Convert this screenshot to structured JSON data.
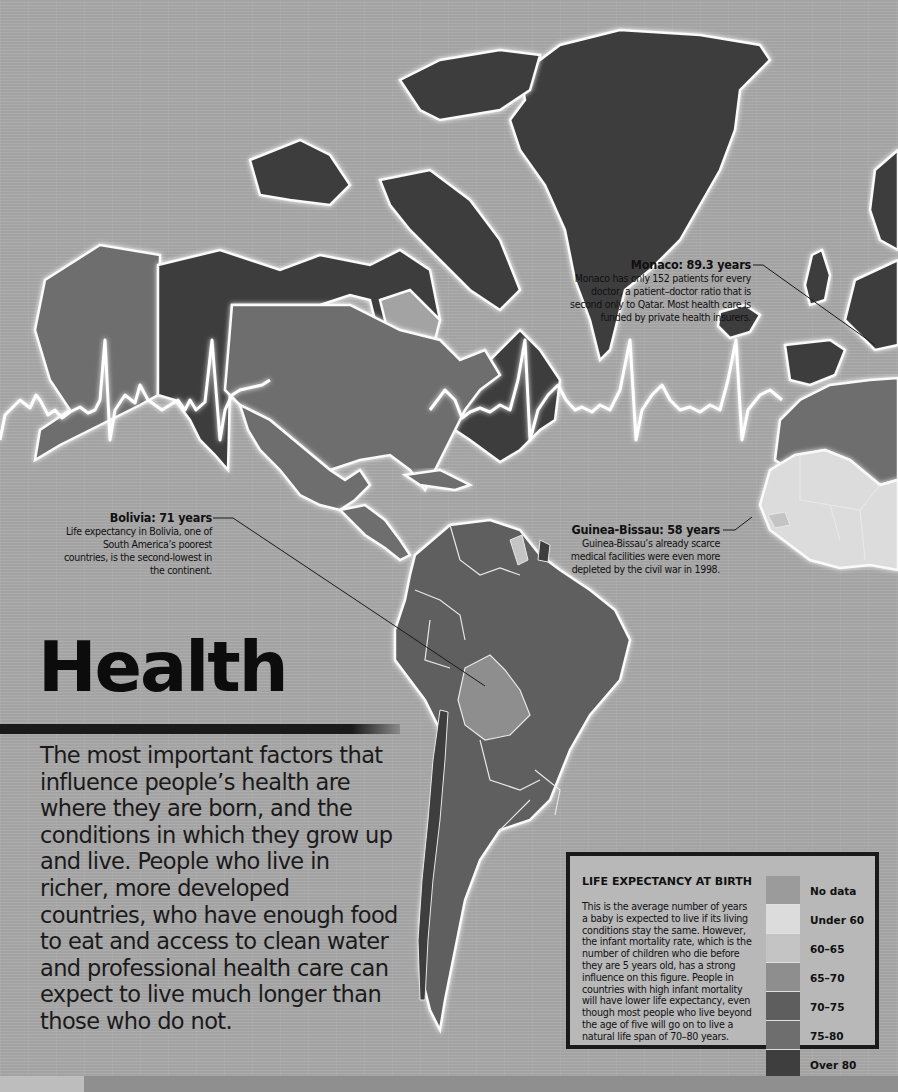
{
  "title": "Health",
  "intro": "The most important factors that influence people’s health are where they are born, and the conditions in which they grow up and live. People who live in richer, more developed countries, who have enough food to eat and access to clean water and professional health care can expect to live much longer than those who do not.",
  "callouts": [
    {
      "id": "monaco",
      "title": "Monaco: 89.3 years",
      "text": "Monaco has only 152 patients for every doctor, a patient–doctor ratio that is second only to Qatar. Most health care is funded by private health insurers."
    },
    {
      "id": "bolivia",
      "title": "Bolivia: 71 years",
      "text": "Life expectancy in Bolivia, one of South America’s poorest countries, is the second-lowest in the continent."
    },
    {
      "id": "guinea_bissau",
      "title": "Guinea-Bissau: 58 years",
      "text": "Guinea-Bissau’s already scarce medical facilities were even more depleted by the civil war in 1998."
    }
  ],
  "legend": {
    "title": "LIFE EXPECTANCY AT BIRTH",
    "description": "This is the average number of years a baby is expected to live if its living conditions stay the same. However, the infant mortality rate, which is the number of children who die before they are 5 years old, has a strong influence on this figure. People in countries with high infant mortality will have lower life expectancy, even though most people who live beyond the age of five will go on to live a natural life span of 70–80 years.",
    "items": [
      {
        "label": "No data",
        "color": "#9b9b9b"
      },
      {
        "label": "Under 60",
        "color": "#dcdcdc"
      },
      {
        "label": "60–65",
        "color": "#c4c4c4"
      },
      {
        "label": "65–70",
        "color": "#8e8e8e"
      },
      {
        "label": "70–75",
        "color": "#5e5e5e"
      },
      {
        "label": "75-80",
        "color": "#6e6e6e"
      },
      {
        "label": "Over 80",
        "color": "#3e3e3e"
      }
    ]
  },
  "map_regions": {
    "canada": "Over 80",
    "greenland": "Over 80",
    "alaska_usa": "75-80",
    "mexico": "75-80",
    "south_america": "70–75",
    "bolivia": "65–70",
    "chile": "Over 80",
    "western_europe": "Over 80",
    "north_africa": "75-80",
    "west_africa": "Under 60"
  },
  "colors": {
    "background": "#a3a3a3",
    "ecg_line": "#ffffff",
    "land_outline": "#fafafa",
    "text": "#111111"
  }
}
